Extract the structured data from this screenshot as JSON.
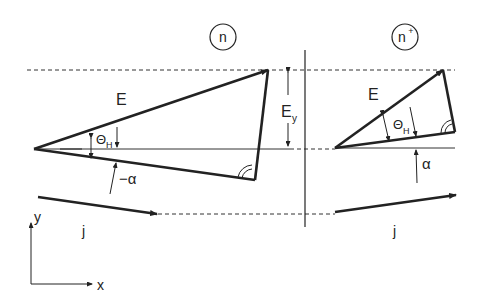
{
  "diagram": {
    "regions": [
      {
        "id": "n",
        "label": "n"
      },
      {
        "id": "n_plus",
        "label": "n",
        "superscript": "+"
      }
    ],
    "left_triangle": {
      "field_label": "E",
      "hall_angle_label": "Θ",
      "hall_angle_sub": "H",
      "alpha_label": "−α"
    },
    "right_triangle": {
      "field_label": "E",
      "hall_angle_label": "Θ",
      "hall_angle_sub": "H",
      "alpha_label": "α"
    },
    "ey_label": "E",
    "ey_sub": "y",
    "current_left_label": "j",
    "current_right_label": "j",
    "axes": {
      "x_label": "x",
      "y_label": "y"
    },
    "colors": {
      "ink": "#222222",
      "background": "#ffffff"
    }
  }
}
